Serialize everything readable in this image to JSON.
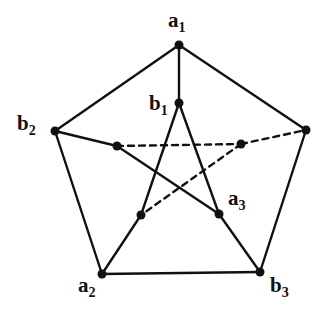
{
  "diagram": {
    "type": "graph",
    "colors": {
      "line": "#111111",
      "vertex": "#111111",
      "background": "#ffffff"
    },
    "vertices": [
      {
        "id": "a1",
        "x": 179,
        "y": 45,
        "label": "a",
        "sub": "1",
        "lx": 170,
        "ly": 28
      },
      {
        "id": "b1",
        "x": 179,
        "y": 103,
        "label": "b",
        "sub": "1",
        "lx": 150,
        "ly": 110
      },
      {
        "id": "b2",
        "x": 55,
        "y": 131,
        "label": "b",
        "sub": "2",
        "lx": 18,
        "ly": 130
      },
      {
        "id": "p_right",
        "x": 306,
        "y": 130,
        "label": "",
        "sub": ""
      },
      {
        "id": "a2",
        "x": 102,
        "y": 274,
        "label": "a",
        "sub": "2",
        "lx": 78,
        "ly": 296
      },
      {
        "id": "b3",
        "x": 260,
        "y": 272,
        "label": "b",
        "sub": "3",
        "lx": 270,
        "ly": 296
      },
      {
        "id": "q_left",
        "x": 117,
        "y": 146,
        "label": "",
        "sub": ""
      },
      {
        "id": "q_right",
        "x": 241,
        "y": 144,
        "label": "",
        "sub": ""
      },
      {
        "id": "a3",
        "x": 219,
        "y": 214,
        "label": "a",
        "sub": "3",
        "lx": 228,
        "ly": 206
      },
      {
        "id": "q_low",
        "x": 141,
        "y": 215,
        "label": "",
        "sub": ""
      }
    ],
    "edges": [
      {
        "from": "a1",
        "to": "b1",
        "style": "solid"
      },
      {
        "from": "a1",
        "to": "b2",
        "style": "solid"
      },
      {
        "from": "a1",
        "to": "p_right",
        "style": "solid"
      },
      {
        "from": "b2",
        "to": "a2",
        "style": "solid"
      },
      {
        "from": "p_right",
        "to": "b3",
        "style": "solid"
      },
      {
        "from": "a2",
        "to": "b3",
        "style": "solid"
      },
      {
        "from": "b2",
        "to": "q_left",
        "style": "solid"
      },
      {
        "from": "q_left",
        "to": "a3",
        "style": "solid"
      },
      {
        "from": "a3",
        "to": "b3",
        "style": "solid"
      },
      {
        "from": "b1",
        "to": "a3",
        "style": "solid"
      },
      {
        "from": "b1",
        "to": "q_low",
        "style": "solid"
      },
      {
        "from": "q_low",
        "to": "a2",
        "style": "solid"
      },
      {
        "from": "q_left",
        "to": "q_right",
        "style": "dashed"
      },
      {
        "from": "q_right",
        "to": "p_right",
        "style": "dashed"
      },
      {
        "from": "q_right",
        "to": "q_low",
        "style": "dashed"
      }
    ],
    "labels": {
      "a1": {
        "main": "a",
        "sub": "1"
      },
      "b1": {
        "main": "b",
        "sub": "1"
      },
      "b2": {
        "main": "b",
        "sub": "2"
      },
      "a2": {
        "main": "a",
        "sub": "2"
      },
      "a3": {
        "main": "a",
        "sub": "3"
      },
      "b3": {
        "main": "b",
        "sub": "3"
      }
    }
  }
}
